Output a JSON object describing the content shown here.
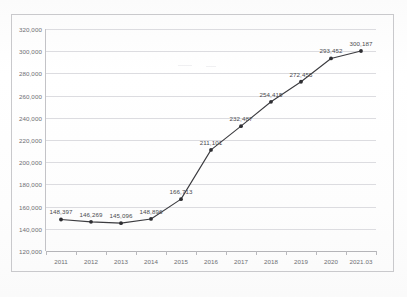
{
  "chart_data": {
    "type": "line",
    "title": "",
    "xlabel": "",
    "ylabel": "",
    "categories": [
      "2011",
      "2012",
      "2013",
      "2014",
      "2015",
      "2016",
      "2017",
      "2018",
      "2019",
      "2020",
      "2021.03"
    ],
    "values": [
      148397,
      146269,
      145096,
      148896,
      166713,
      211101,
      232487,
      254415,
      272455,
      293452,
      300187
    ],
    "point_labels": [
      "148,397",
      "146,269",
      "145,096",
      "148,896",
      "166,713",
      "211,101",
      "232,487",
      "254,415",
      "272,455",
      "293,452",
      "300,187"
    ],
    "ylim": [
      120000,
      320000
    ],
    "ytick_values": [
      120000,
      140000,
      160000,
      180000,
      200000,
      220000,
      240000,
      260000,
      280000,
      300000,
      320000
    ],
    "ytick_labels": [
      "120,000",
      "140,000",
      "160,000",
      "180,000",
      "200,000",
      "220,000",
      "240,000",
      "260,000",
      "280,000",
      "300,000",
      "320,000"
    ],
    "grid": true,
    "legend": false,
    "legend_position": "none",
    "series": [
      {
        "name": "",
        "values": [
          148397,
          146269,
          145096,
          148896,
          166713,
          211101,
          232487,
          254415,
          272455,
          293452,
          300187
        ]
      }
    ],
    "line_color": "#3b3b3f",
    "marker_color": "#2e2e32",
    "grid_color": "#dcdce0",
    "axis_color": "#b4b4b8",
    "label_color": "#6e6e72"
  }
}
